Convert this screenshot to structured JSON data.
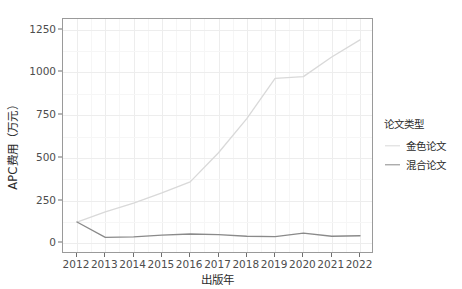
{
  "chart_data": {
    "type": "line",
    "title": "",
    "xlabel": "出版年",
    "ylabel": "APC费用（万元）",
    "categories": [
      "2012",
      "2013",
      "2014",
      "2015",
      "2016",
      "2017",
      "2018",
      "2019",
      "2020",
      "2021",
      "2022"
    ],
    "x": [
      2012,
      2013,
      2014,
      2015,
      2016,
      2017,
      2018,
      2019,
      2020,
      2021,
      2022
    ],
    "xlim": [
      2012,
      2022
    ],
    "ylim": [
      0,
      1250
    ],
    "yticks": [
      0,
      250,
      500,
      750,
      1000,
      1250
    ],
    "ytick_labels": [
      "0",
      "250",
      "500",
      "750",
      "1000",
      "1250"
    ],
    "grid": true,
    "legend_position": "right",
    "legend_title": "论文类型",
    "series": [
      {
        "name": "金色论文",
        "color": "#d9d9d9",
        "values": [
          125,
          185,
          235,
          295,
          360,
          530,
          730,
          965,
          975,
          1090,
          1190
        ]
      },
      {
        "name": "混合论文",
        "color": "#8a8a8a",
        "values": [
          125,
          35,
          38,
          48,
          55,
          52,
          42,
          40,
          60,
          42,
          45
        ]
      }
    ]
  },
  "axes": {
    "y_title": "APC费用（万元）",
    "x_title": "出版年",
    "y_tick_labels": [
      "1250",
      "1000",
      "750",
      "500",
      "250",
      "0"
    ],
    "x_tick_labels": [
      "2012",
      "2013",
      "2014",
      "2015",
      "2016",
      "2017",
      "2018",
      "2019",
      "2020",
      "2021",
      "2022"
    ]
  },
  "legend": {
    "title": "论文类型",
    "items": [
      {
        "label": "金色论文",
        "color": "#d9d9d9"
      },
      {
        "label": "混合论文",
        "color": "#8a8a8a"
      }
    ]
  },
  "colors": {
    "panel_background": "#ffffff",
    "panel_border": "#9a9a9a",
    "grid_major": "#ededed",
    "grid_minor": "#f6f6f6",
    "axis_text": "#4d4d4d",
    "title_text": "#2b2b2b"
  }
}
